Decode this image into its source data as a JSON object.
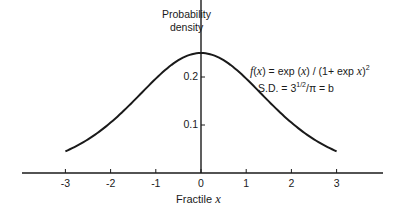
{
  "chart_data": {
    "type": "line",
    "title": "",
    "xlabel": "Fractile x",
    "ylabel": "Probability density",
    "xlim": [
      -3,
      3
    ],
    "ylim": [
      0,
      0.25
    ],
    "x_ticks": [
      -3,
      -2,
      -1,
      0,
      1,
      2,
      3
    ],
    "x_tick_labels": [
      "-3",
      "-2",
      "-1",
      "0",
      "1",
      "2",
      "3"
    ],
    "y_ticks": [
      0.1,
      0.2
    ],
    "y_tick_labels": [
      "0.1",
      "0.2"
    ],
    "grid": false,
    "legend": null,
    "annotations": [
      "f(x) = exp(x) / (1+ exp x)^2",
      "S.D. = 3^1/2/π = b"
    ],
    "series": [
      {
        "name": "Logistic density f(x)",
        "x": [
          -3,
          -2.5,
          -2,
          -1.5,
          -1,
          -0.5,
          0,
          0.5,
          1,
          1.5,
          2,
          2.5,
          3
        ],
        "y": [
          0.0452,
          0.0701,
          0.105,
          0.149,
          0.197,
          0.235,
          0.25,
          0.235,
          0.197,
          0.149,
          0.105,
          0.0701,
          0.0452
        ]
      }
    ]
  },
  "labels": {
    "ylabel_line1": "Probability",
    "ylabel_line2": "density",
    "xlabel_text": "Fractile",
    "xlabel_var": "x",
    "formula_line1_pre": "f",
    "formula_line1_a": "(",
    "formula_line1_var1": "x",
    "formula_line1_b": ") = exp (",
    "formula_line1_var2": "x",
    "formula_line1_c": ") / (1+ exp ",
    "formula_line1_var3": "x",
    "formula_line1_d": ")",
    "formula_line1_exp": "2",
    "formula_line2_a": "S.D. = 3",
    "formula_line2_exp": "1/2",
    "formula_line2_b": "/π = b"
  },
  "colors": {
    "ink": "#1a1a1a",
    "background": "#ffffff"
  }
}
